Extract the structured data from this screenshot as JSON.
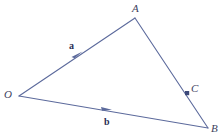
{
  "figure": {
    "name": "vector-triangle-diagram",
    "background_color": "#ffffff",
    "stroke_color": "#5c6a9c",
    "label_color": "#3e3f5e",
    "vector_label_color": "#2b2f55",
    "point_color": "#3d4a7a",
    "width": 223,
    "height": 137
  },
  "points": {
    "O": {
      "label": "O",
      "x": 19,
      "y": 96
    },
    "A": {
      "label": "A",
      "x": 135,
      "y": 18
    },
    "B": {
      "label": "B",
      "x": 208,
      "y": 128
    },
    "C": {
      "label": "C",
      "x": 187,
      "y": 93
    }
  },
  "vectors": {
    "a": {
      "label": "a",
      "from": "O",
      "to": "A",
      "arrow_x": 78,
      "arrow_y": 55
    },
    "b": {
      "label": "b",
      "from": "O",
      "to": "B",
      "arrow_x": 107,
      "arrow_y": 109
    }
  },
  "segments": [
    {
      "name": "segment-OA",
      "from": "O",
      "to": "A"
    },
    {
      "name": "segment-AB",
      "from": "A",
      "to": "B"
    },
    {
      "name": "segment-OB",
      "from": "O",
      "to": "B"
    }
  ]
}
